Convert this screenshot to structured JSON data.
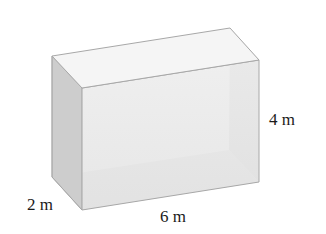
{
  "figure": {
    "type": "rectangular prism",
    "labels": {
      "height": "4 m",
      "depth": "2 m",
      "length": "6 m"
    },
    "colors": {
      "top_face": "#f4f4f4",
      "front_face": "#e8e8e8",
      "left_face": "#cfcfcf",
      "right_face": "#dcdcdc",
      "edge": "#a8a8a8"
    }
  }
}
